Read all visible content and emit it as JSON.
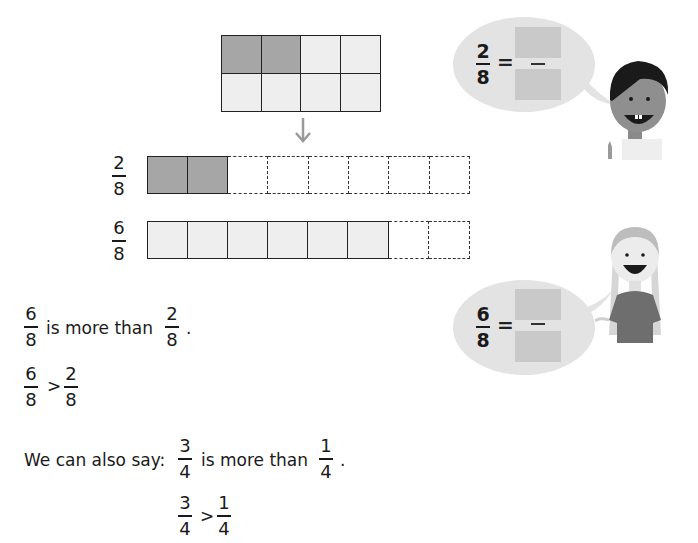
{
  "grid_model": {
    "rows": 2,
    "columns": 4,
    "shaded_cells": 2,
    "total_cells": 8
  },
  "arrow": {
    "icon": "down-arrow-icon",
    "glyph": "↓"
  },
  "bars": [
    {
      "fraction": {
        "numerator": "2",
        "denominator": "8"
      },
      "shaded": 2,
      "light": 0,
      "dashed": 6
    },
    {
      "fraction": {
        "numerator": "6",
        "denominator": "8"
      },
      "shaded": 0,
      "light": 6,
      "dashed": 2
    }
  ],
  "statement1": {
    "left": {
      "numerator": "6",
      "denominator": "8"
    },
    "text": "is more than",
    "right": {
      "numerator": "2",
      "denominator": "8"
    },
    "end": "."
  },
  "inequality1": {
    "left": {
      "numerator": "6",
      "denominator": "8"
    },
    "symbol": ">",
    "right": {
      "numerator": "2",
      "denominator": "8"
    }
  },
  "statement2": {
    "prefix": "We can also say:",
    "left": {
      "numerator": "3",
      "denominator": "4"
    },
    "text": "is more than",
    "right": {
      "numerator": "1",
      "denominator": "4"
    },
    "end": "."
  },
  "inequality2": {
    "left": {
      "numerator": "3",
      "denominator": "4"
    },
    "symbol": ">",
    "right": {
      "numerator": "1",
      "denominator": "4"
    }
  },
  "bubble_boy": {
    "fraction": {
      "numerator": "2",
      "denominator": "8"
    },
    "equals": "=",
    "answer_numerator": "",
    "answer_denominator": ""
  },
  "bubble_girl": {
    "fraction": {
      "numerator": "6",
      "denominator": "8"
    },
    "equals": "=",
    "answer_numerator": "",
    "answer_denominator": ""
  },
  "colors": {
    "shaded": "#a6a6a6",
    "light": "#eeeeee",
    "bubble": "#e3e3e3",
    "answer_box": "#c9c9c9",
    "line": "#222222"
  }
}
